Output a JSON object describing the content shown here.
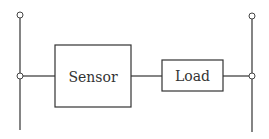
{
  "diagram": {
    "type": "circuit-block-diagram",
    "colors": {
      "line": "#333333",
      "background": "#ffffff"
    },
    "rails": [
      {
        "id": "left-rail",
        "x": 20,
        "y_top": 15,
        "y_bottom": 130,
        "terminal_top": true,
        "junction_y": 76
      },
      {
        "id": "right-rail",
        "x": 252,
        "y_top": 16,
        "y_bottom": 132,
        "terminal_top": true,
        "junction_y": 76
      }
    ],
    "blocks": [
      {
        "id": "sensor",
        "label": "Sensor",
        "x": 55,
        "y": 45,
        "width": 76,
        "height": 62
      },
      {
        "id": "load",
        "label": "Load",
        "x": 162,
        "y": 60,
        "width": 61,
        "height": 31
      }
    ],
    "connections": [
      {
        "from": "left-rail",
        "to": "sensor"
      },
      {
        "from": "sensor",
        "to": "load"
      },
      {
        "from": "load",
        "to": "right-rail"
      }
    ]
  }
}
